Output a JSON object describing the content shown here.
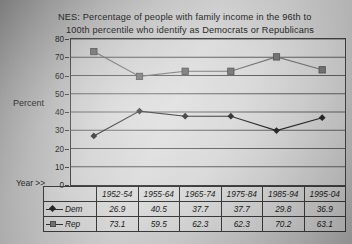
{
  "title": {
    "line1": "NES:  Percentage of people with family income in the 96th to",
    "line2": "100th percentile who identify as Democrats or Republicans"
  },
  "axis": {
    "y_caption": "Percent",
    "x_caption": "Year >>",
    "y_ticks": [
      "80",
      "70",
      "60",
      "50",
      "40",
      "30",
      "20",
      "10",
      "0"
    ]
  },
  "table": {
    "year_header_blank": "",
    "years": [
      "1952-54",
      "1955-64",
      "1965-74",
      "1975-84",
      "1985-94",
      "1995-04"
    ],
    "rows": [
      {
        "label": "Dem",
        "marker": "diamond-marker",
        "color": "#1e1e1e",
        "values": [
          "26.9",
          "40.5",
          "37.7",
          "37.7",
          "29.8",
          "36.9"
        ]
      },
      {
        "label": "Rep",
        "marker": "square-marker",
        "color": "#6f6f6f",
        "values": [
          "73.1",
          "59.5",
          "62.3",
          "62.3",
          "70.2",
          "63.1"
        ]
      }
    ]
  },
  "chart_data": {
    "type": "line",
    "title": "NES:  Percentage of people with family income in the 96th to 100th percentile who identify as Democrats or Republicans",
    "xlabel": "Year >>",
    "ylabel": "Percent",
    "categories": [
      "1952-54",
      "1955-64",
      "1965-74",
      "1975-84",
      "1985-94",
      "1995-04"
    ],
    "series": [
      {
        "name": "Dem",
        "marker": "diamond",
        "color": "#1e1e1e",
        "values": [
          26.9,
          40.5,
          37.7,
          37.7,
          29.8,
          36.9
        ]
      },
      {
        "name": "Rep",
        "marker": "square",
        "color": "#6f6f6f",
        "values": [
          73.1,
          59.5,
          62.3,
          62.3,
          70.2,
          63.1
        ]
      }
    ],
    "ylim": [
      0,
      80
    ],
    "ytick_step": 10,
    "grid": "horizontal",
    "legend": "in-data-table"
  }
}
